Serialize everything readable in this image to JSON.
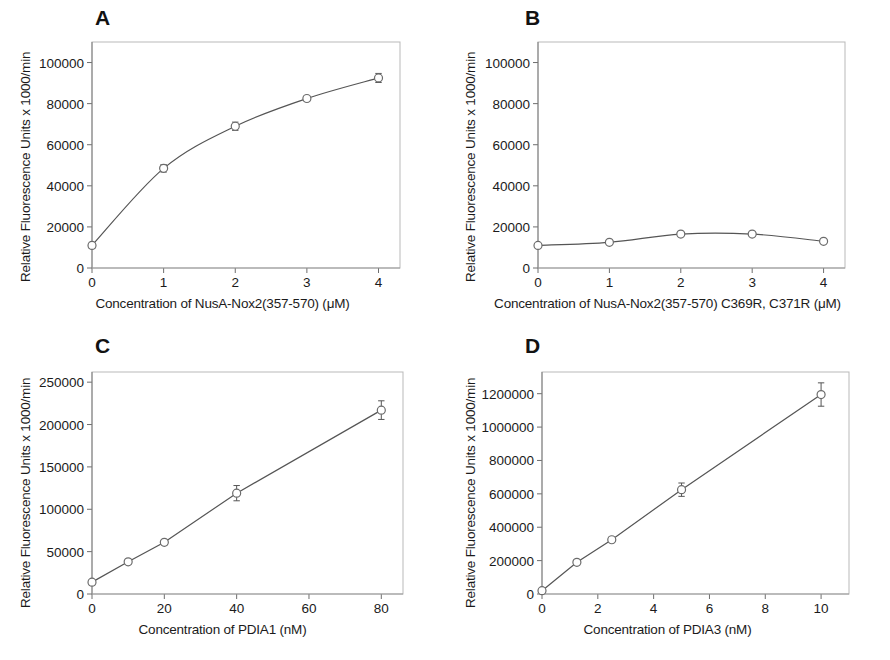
{
  "figure": {
    "title": "",
    "background": "#ffffff",
    "panel_letters": [
      "A",
      "B",
      "C",
      "D"
    ],
    "shared_ylabel": "Relative Fluorescence Units x 1000/min",
    "marker_style": "open-circle",
    "line_color": "#555555",
    "marker_edge_color": "#6b6b6b",
    "marker_face_color": "#ffffff",
    "frame_color": "#b9b9b9"
  },
  "chart_data": [
    {
      "panel": "A",
      "type": "line",
      "title": "A",
      "xlabel": "Concentration of NusA-Nox2(357-570) (μM)",
      "ylabel": "Relative Fluorescence Units x 1000/min",
      "x": [
        0,
        1,
        2,
        3,
        4
      ],
      "values": [
        11000,
        48500,
        69000,
        82500,
        92500
      ],
      "yerr": [
        1500,
        1800,
        2000,
        1200,
        2200
      ],
      "xlim": [
        0,
        4.3
      ],
      "ylim": [
        0,
        110000
      ],
      "xticks": [
        0,
        1,
        2,
        3,
        4
      ],
      "xtick_labels": [
        "0",
        "1",
        "2",
        "3",
        "4"
      ],
      "yticks": [
        0,
        20000,
        40000,
        60000,
        80000,
        100000
      ],
      "ytick_labels": [
        "0",
        "20000",
        "40000",
        "60000",
        "80000",
        "100000"
      ],
      "grid": false,
      "legend": "none",
      "curve": "saturating"
    },
    {
      "panel": "B",
      "type": "line",
      "title": "B",
      "xlabel": "Concentration of NusA-Nox2(357-570) C369R, C371R (μM)",
      "ylabel": "Relative Fluorescence Units x 1000/min",
      "x": [
        0,
        1,
        2,
        3,
        4
      ],
      "values": [
        11000,
        12500,
        16500,
        16500,
        13000
      ],
      "yerr": [
        900,
        700,
        800,
        700,
        900
      ],
      "xlim": [
        0,
        4.3
      ],
      "ylim": [
        0,
        110000
      ],
      "xticks": [
        0,
        1,
        2,
        3,
        4
      ],
      "xtick_labels": [
        "0",
        "1",
        "2",
        "3",
        "4"
      ],
      "yticks": [
        0,
        20000,
        40000,
        60000,
        80000,
        100000
      ],
      "ytick_labels": [
        "0",
        "20000",
        "40000",
        "60000",
        "80000",
        "100000"
      ],
      "grid": false,
      "legend": "none",
      "curve": "flat"
    },
    {
      "panel": "C",
      "type": "line",
      "title": "C",
      "xlabel": "Concentration of PDIA1 (nM)",
      "ylabel": "Relative Fluorescence Units x 1000/min",
      "x": [
        0,
        10,
        20,
        40,
        80
      ],
      "values": [
        14000,
        38000,
        61000,
        119000,
        217000
      ],
      "yerr": [
        3000,
        3000,
        3000,
        9000,
        11000
      ],
      "xlim": [
        0,
        86
      ],
      "ylim": [
        0,
        262000
      ],
      "xticks": [
        0,
        20,
        40,
        60,
        80
      ],
      "xtick_labels": [
        "0",
        "20",
        "40",
        "60",
        "80"
      ],
      "yticks": [
        0,
        50000,
        100000,
        150000,
        200000,
        250000
      ],
      "ytick_labels": [
        "0",
        "50000",
        "100000",
        "150000",
        "200000",
        "250000"
      ],
      "grid": false,
      "legend": "none",
      "curve": "linear"
    },
    {
      "panel": "D",
      "type": "line",
      "title": "D",
      "xlabel": "Concentration of PDIA3 (nM)",
      "ylabel": "Relative Fluorescence Units x 1000/min",
      "x": [
        0,
        1.25,
        2.5,
        5,
        10
      ],
      "values": [
        20000,
        190000,
        325000,
        625000,
        1195000
      ],
      "yerr": [
        12000,
        15000,
        15000,
        40000,
        70000
      ],
      "xlim": [
        0,
        11
      ],
      "ylim": [
        0,
        1330000
      ],
      "xticks": [
        0,
        2,
        4,
        6,
        8,
        10
      ],
      "xtick_labels": [
        "0",
        "2",
        "4",
        "6",
        "8",
        "10"
      ],
      "yticks": [
        0,
        200000,
        400000,
        600000,
        800000,
        1000000,
        1200000
      ],
      "ytick_labels": [
        "0",
        "200000",
        "400000",
        "600000",
        "800000",
        "1000000",
        "1200000"
      ],
      "grid": false,
      "legend": "none",
      "curve": "linear"
    }
  ]
}
